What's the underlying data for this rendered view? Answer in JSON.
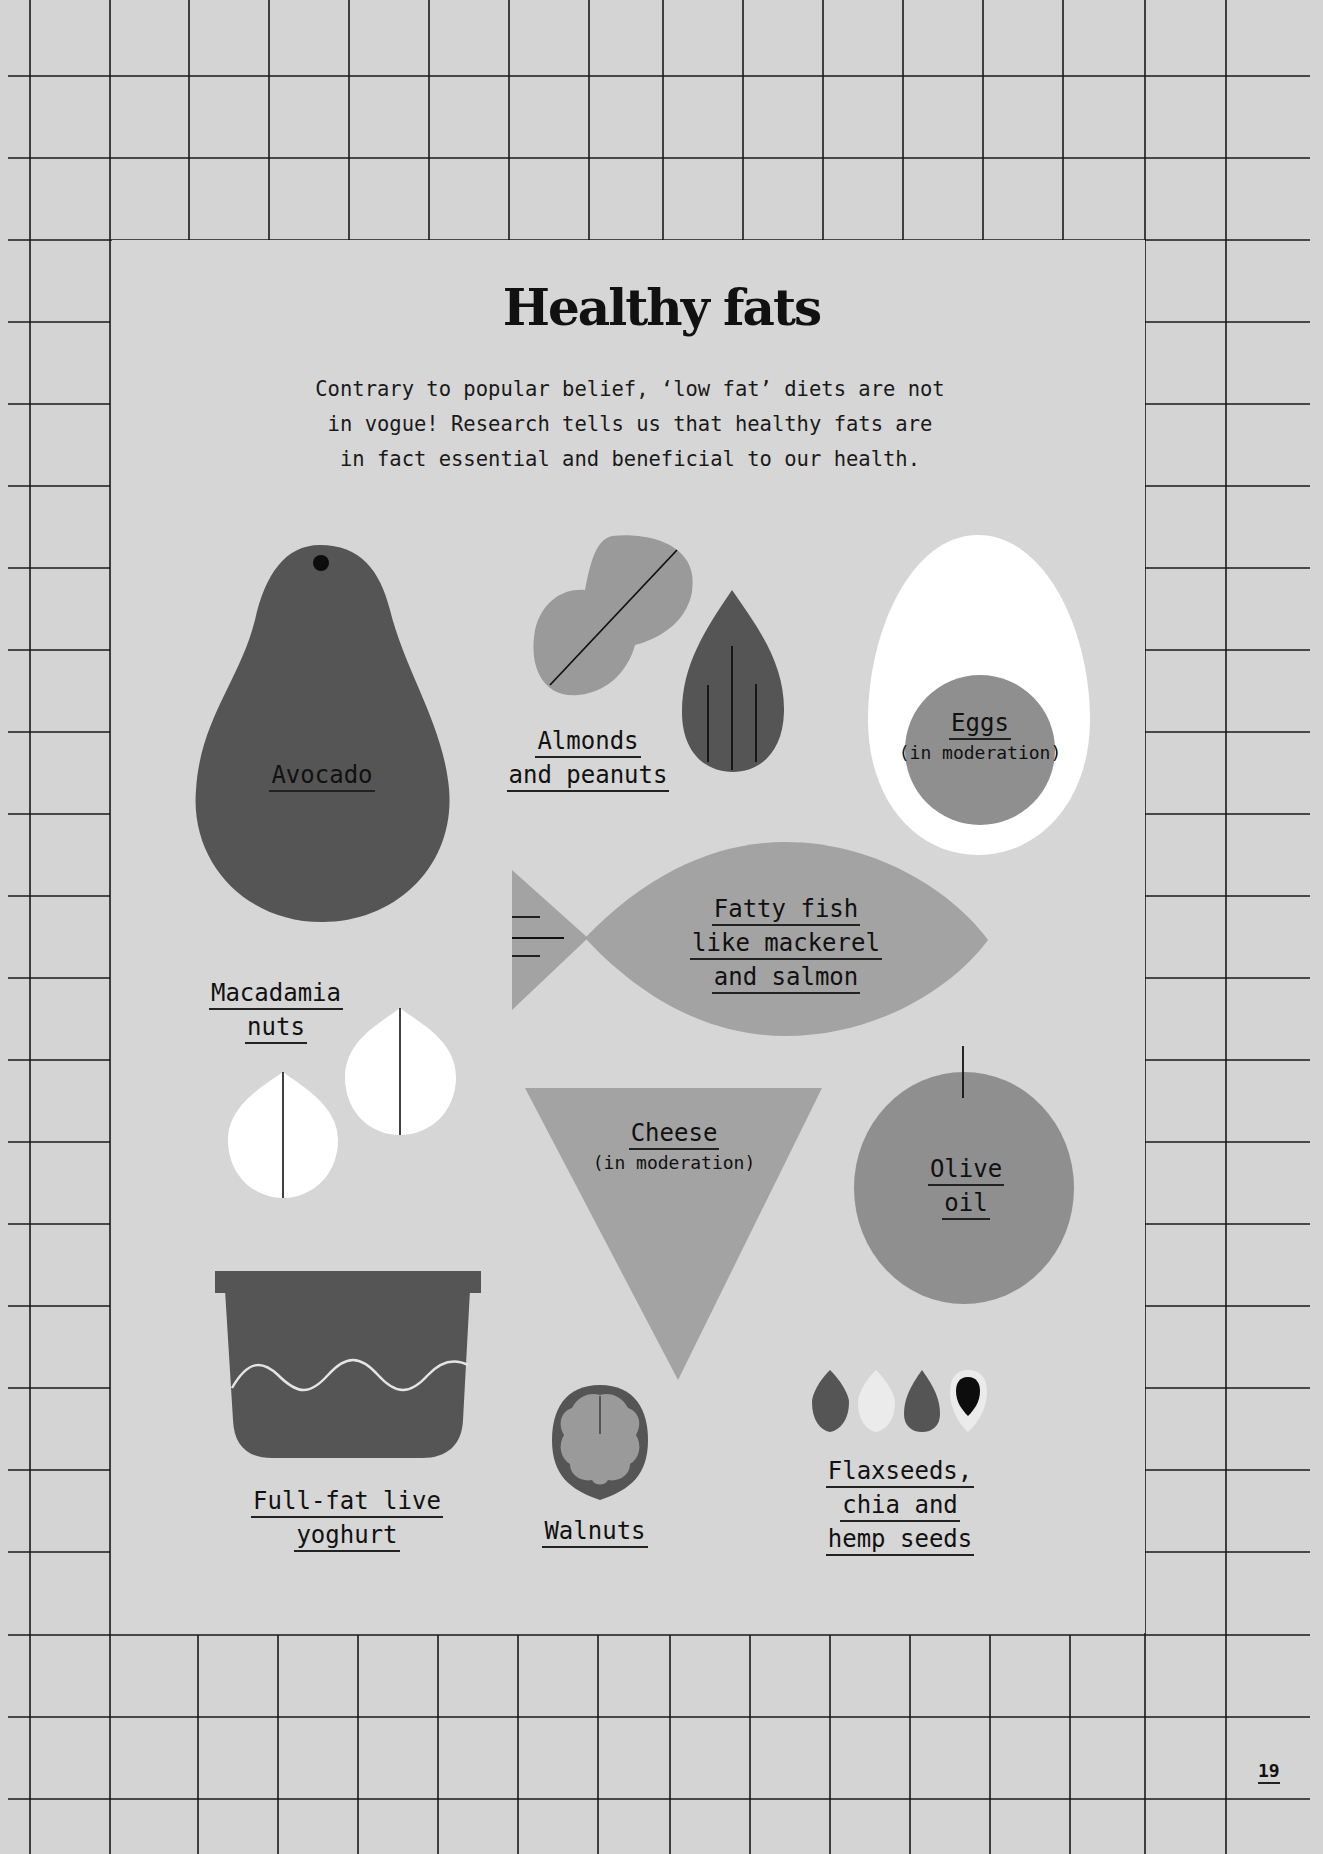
{
  "page": {
    "title": "Healthy fats",
    "intro_lines": [
      "Contrary to popular belief, ‘low fat’ diets are not",
      "in vogue! Research tells us that healthy fats are",
      "in fact essential and beneficial to our health."
    ],
    "page_number": "19"
  },
  "colors": {
    "background": "#d4d4d4",
    "grid_line": "#1a1a1a",
    "dark_grey": "#555555",
    "mid_grey": "#8f8f8f",
    "light_grey": "#a3a3a3",
    "white": "#ffffff",
    "black": "#111111"
  },
  "foods": [
    {
      "id": "avocado",
      "icon": "avocado-icon",
      "lines": [
        "Avocado"
      ],
      "note": ""
    },
    {
      "id": "almonds-peanuts",
      "icon": "almond-peanut-icon",
      "lines": [
        "Almonds",
        "and peanuts"
      ],
      "note": ""
    },
    {
      "id": "eggs",
      "icon": "egg-icon",
      "lines": [
        "Eggs"
      ],
      "note": "(in moderation)"
    },
    {
      "id": "fatty-fish",
      "icon": "fish-icon",
      "lines": [
        "Fatty fish",
        "like mackerel",
        "and salmon"
      ],
      "note": ""
    },
    {
      "id": "macadamia",
      "icon": "macadamia-icon",
      "lines": [
        "Macadamia",
        "nuts"
      ],
      "note": ""
    },
    {
      "id": "cheese",
      "icon": "cheese-icon",
      "lines": [
        "Cheese"
      ],
      "note": "(in moderation)"
    },
    {
      "id": "olive-oil",
      "icon": "olive-icon",
      "lines": [
        "Olive",
        "oil"
      ],
      "note": ""
    },
    {
      "id": "yoghurt",
      "icon": "yoghurt-pot-icon",
      "lines": [
        "Full-fat live",
        "yoghurt"
      ],
      "note": ""
    },
    {
      "id": "walnuts",
      "icon": "walnut-icon",
      "lines": [
        "Walnuts"
      ],
      "note": ""
    },
    {
      "id": "seeds",
      "icon": "seeds-icon",
      "lines": [
        "Flaxseeds,",
        "chia and",
        "hemp seeds"
      ],
      "note": ""
    }
  ]
}
